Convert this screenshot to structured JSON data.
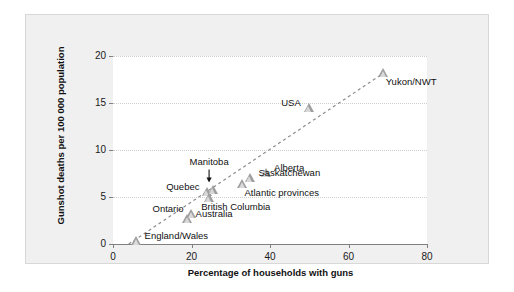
{
  "chart_data": {
    "type": "scatter",
    "title": "",
    "xlabel": "Percentage of households with guns",
    "ylabel": "Gunshot deaths per 100 000 population",
    "xlim": [
      0,
      80
    ],
    "ylim": [
      0,
      20
    ],
    "xticks": [
      "0",
      "20",
      "40",
      "60",
      "80"
    ],
    "xtick_values": [
      0,
      20,
      40,
      60,
      80
    ],
    "yticks": [
      "0",
      "5",
      "10",
      "15",
      "20"
    ],
    "ytick_values": [
      0,
      5,
      10,
      15,
      20
    ],
    "grid": "horizontal-dotted",
    "legend": "none",
    "marker": "triangle",
    "points": [
      {
        "label": "England/Wales",
        "x": 6.0,
        "y": 0.3,
        "label_pos": "right"
      },
      {
        "label": "Australia",
        "x": 19.0,
        "y": 2.7,
        "label_pos": "right"
      },
      {
        "label": "Ontario",
        "x": 20.0,
        "y": 3.2,
        "label_pos": "left"
      },
      {
        "label": "Quebec",
        "x": 24.0,
        "y": 5.5,
        "label_pos": "left"
      },
      {
        "label": "British Columbia",
        "x": 24.5,
        "y": 4.9,
        "label_pos": "below"
      },
      {
        "label": "Manitoba",
        "x": 25.5,
        "y": 5.7,
        "label_pos": "arrow-above"
      },
      {
        "label": "Atlantic provinces",
        "x": 33.0,
        "y": 6.4,
        "label_pos": "below-right"
      },
      {
        "label": "Saskatchewan",
        "x": 35.0,
        "y": 7.0,
        "label_pos": "right"
      },
      {
        "label": "Alberta",
        "x": 39.0,
        "y": 7.6,
        "label_pos": "right"
      },
      {
        "label": "USA",
        "x": 50.0,
        "y": 14.5,
        "label_pos": "left"
      },
      {
        "label": "Yukon/NWT",
        "x": 69.0,
        "y": 18.2,
        "label_pos": "below-right"
      }
    ],
    "trendline": {
      "style": "dashed",
      "x_start": 4.0,
      "y_start": 0.0,
      "x_end": 69.0,
      "y_end": 18.2
    }
  },
  "colors": {
    "panel_bg": "#f0f0f0",
    "plot_bg": "#ffffff",
    "marker_fill": "#d9d9d9",
    "marker_edge": "#9e9e9e",
    "axis": "#808080",
    "grid": "#cfcfcf",
    "text": "#111111"
  }
}
